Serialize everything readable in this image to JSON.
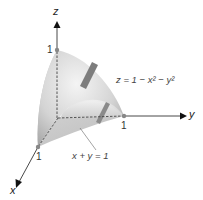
{
  "figure": {
    "type": "3d-surface-diagram",
    "axes": {
      "x": {
        "label": "x",
        "tick": "1"
      },
      "y": {
        "label": "y",
        "tick": "1"
      },
      "z": {
        "label": "z",
        "tick": "1"
      }
    },
    "annotations": {
      "surface_equation": "z = 1 − x² − y²",
      "plane_equation": "x + y = 1"
    },
    "colors": {
      "surface_light": "#e8e8e8",
      "surface_dark": "#9a9a9a",
      "arrow_accent": "#7d7d7d",
      "axis": "#333333",
      "point": "#888888"
    }
  }
}
